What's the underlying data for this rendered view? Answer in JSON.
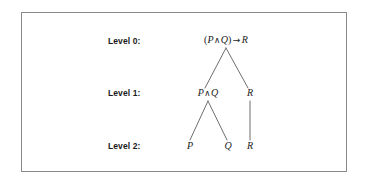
{
  "figure": {
    "background_color": "#ffffff",
    "frame_color": "#8a8a8a",
    "text_color": "#1a1a1a",
    "edge_color": "#6e6e6e"
  },
  "levels": [
    {
      "label": "Level 0:"
    },
    {
      "label": "Level 1:"
    },
    {
      "label": "Level 2:"
    }
  ],
  "nodes": {
    "root": {
      "open_paren": "(",
      "left": "P",
      "conjunction": "∧",
      "right": "Q",
      "close_paren": ")",
      "implication": "→",
      "consequent": "R"
    },
    "level1_left": {
      "left": "P",
      "conjunction": "∧",
      "right": "Q"
    },
    "level1_right": {
      "text": "R"
    },
    "level2_p": {
      "text": "P"
    },
    "level2_q": {
      "text": "Q"
    },
    "level2_r": {
      "text": "R"
    }
  }
}
